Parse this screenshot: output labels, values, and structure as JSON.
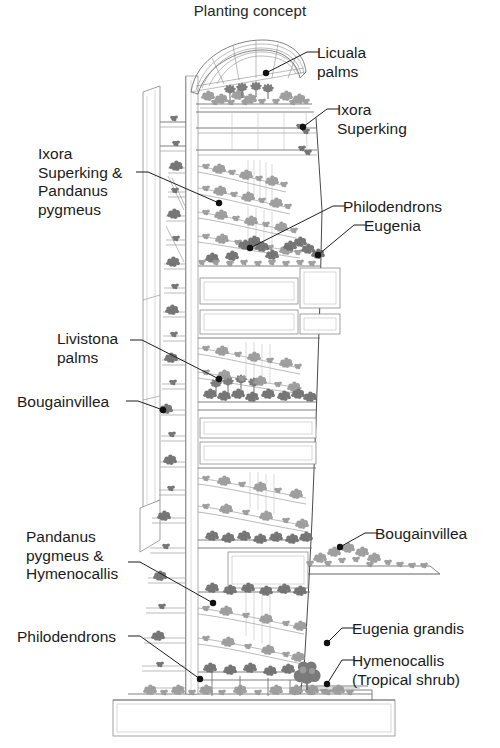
{
  "figure": {
    "title": "Planting concept",
    "type": "architectural-section-diagram",
    "background_color": "#ffffff",
    "ink_color": "#1b1b1b"
  },
  "callouts": [
    {
      "id": "licuala-palms",
      "label": "Licuala\npalms",
      "side": "right",
      "text_x": 317,
      "text_y": 44,
      "leader": {
        "elbow_x": 307,
        "elbow_y": 52,
        "tip_x": 266,
        "tip_y": 73
      },
      "target": "roof canopy garden palms"
    },
    {
      "id": "ixora-superking",
      "label": "Ixora\nSuperking",
      "side": "right",
      "text_x": 337,
      "text_y": 101,
      "leader": {
        "elbow_x": 327,
        "elbow_y": 109,
        "tip_x": 303,
        "tip_y": 127
      },
      "target": "upper terrace planter"
    },
    {
      "id": "ixora-superking-pandanus-pygmeus",
      "label": "Ixora\nSuperking &\nPandanus\npygmeus",
      "side": "left",
      "text_x": 38,
      "text_y": 145,
      "leader": {
        "elbow_x": 148,
        "elbow_y": 172,
        "tip_x": 219,
        "tip_y": 203
      },
      "target": "upper-middle spiral planter band"
    },
    {
      "id": "philodendrons-upper",
      "label": "Philodendrons",
      "side": "right",
      "text_x": 343,
      "text_y": 198,
      "leader": {
        "elbow_x": 333,
        "elbow_y": 206,
        "tip_x": 250,
        "tip_y": 248
      },
      "target": "mid tower cascade planting"
    },
    {
      "id": "eugenia",
      "label": "Eugenia",
      "side": "right",
      "text_x": 364,
      "text_y": 217,
      "leader": {
        "elbow_x": 354,
        "elbow_y": 225,
        "tip_x": 318,
        "tip_y": 255
      },
      "target": "mid tower shrub mass"
    },
    {
      "id": "livistona-palms",
      "label": "Livistona\npalms",
      "side": "left",
      "text_x": 57,
      "text_y": 330,
      "leader": {
        "elbow_x": 142,
        "elbow_y": 340,
        "tip_x": 219,
        "tip_y": 379
      },
      "target": "mid-low fan palm cluster"
    },
    {
      "id": "bougainvillea-left",
      "label": "Bougainvillea",
      "side": "left",
      "text_x": 17,
      "text_y": 393,
      "leader": {
        "elbow_x": 138,
        "elbow_y": 401,
        "tip_x": 163,
        "tip_y": 410
      },
      "target": "west facade balcony planter"
    },
    {
      "id": "pandanus-pygmeus-hymenocallis",
      "label": "Pandanus\npygmeus &\nHymenocallis",
      "side": "left",
      "text_x": 26,
      "text_y": 528,
      "leader": {
        "elbow_x": 140,
        "elbow_y": 562,
        "tip_x": 213,
        "tip_y": 603
      },
      "target": "lower tower planting band"
    },
    {
      "id": "bougainvillea-right",
      "label": "Bougainvillea",
      "side": "right",
      "text_x": 375,
      "text_y": 525,
      "leader": {
        "elbow_x": 365,
        "elbow_y": 533,
        "tip_x": 340,
        "tip_y": 547
      },
      "target": "podium roof garden"
    },
    {
      "id": "philodendrons-lower",
      "label": "Philodendrons",
      "side": "left",
      "text_x": 17,
      "text_y": 628,
      "leader": {
        "elbow_x": 140,
        "elbow_y": 636,
        "tip_x": 200,
        "tip_y": 679
      },
      "target": "base tower planting"
    },
    {
      "id": "eugenia-grandis",
      "label": "Eugenia grandis",
      "side": "right",
      "text_x": 352,
      "text_y": 620,
      "leader": {
        "elbow_x": 342,
        "elbow_y": 628,
        "tip_x": 327,
        "tip_y": 643
      },
      "target": "ground level tree"
    },
    {
      "id": "hymenocallis-tropical-shrub",
      "label": "Hymenocallis\n(Tropical shrub)",
      "side": "right",
      "text_x": 352,
      "text_y": 652,
      "leader": {
        "elbow_x": 342,
        "elbow_y": 660,
        "tip_x": 327,
        "tip_y": 684
      },
      "target": "ground level shrub bed"
    }
  ],
  "plant_species": [
    "Licuala palms",
    "Ixora Superking",
    "Pandanus pygmeus",
    "Philodendrons",
    "Eugenia",
    "Livistona palms",
    "Bougainvillea",
    "Hymenocallis",
    "Eugenia grandis"
  ],
  "building_elements": [
    "curved vaulted roof canopy",
    "roof-top sky garden",
    "vertical service core",
    "stacked floor plates",
    "spiral planter ramps",
    "west sun-shading louvre wall",
    "sky court voids",
    "podium roof garden",
    "ground plinth / base platform"
  ]
}
